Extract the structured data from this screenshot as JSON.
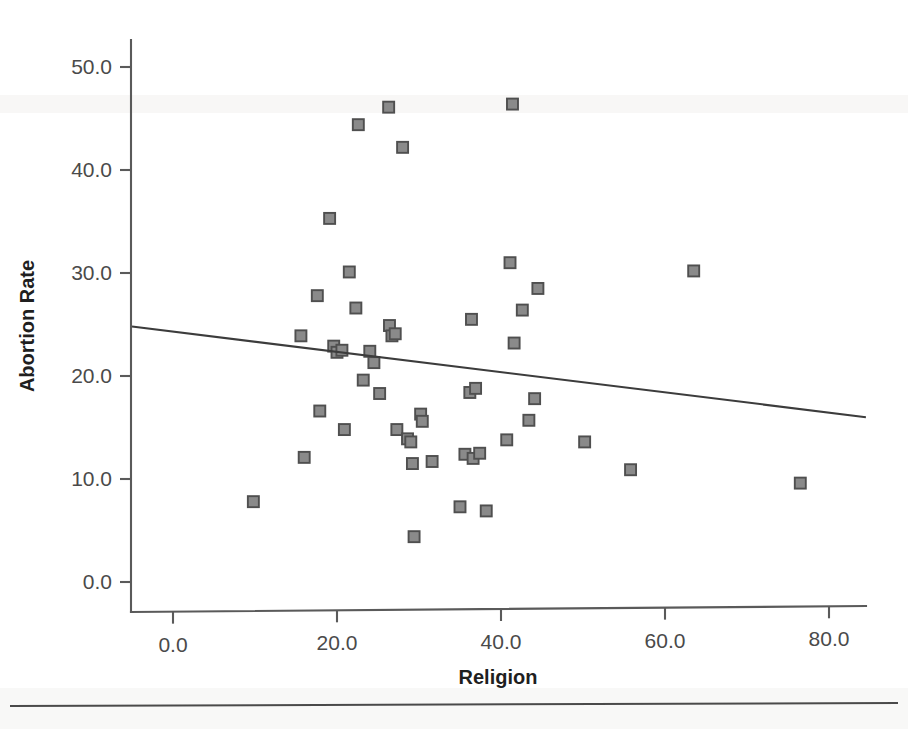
{
  "chart_data": {
    "type": "scatter",
    "title": "",
    "xlabel": "Religion",
    "ylabel": "Abortion Rate",
    "xlim": [
      -5.0,
      84.5
    ],
    "ylim": [
      -2.0,
      52.0
    ],
    "xticks": [
      "0.0",
      "20.0",
      "40.0",
      "60.0",
      "80.0"
    ],
    "xtick_values": [
      0,
      20,
      40,
      60,
      80
    ],
    "yticks": [
      "0.0",
      "10.0",
      "20.0",
      "30.0",
      "40.0",
      "50.0"
    ],
    "ytick_values": [
      0,
      10,
      20,
      30,
      40,
      50
    ],
    "grid": false,
    "legend": null,
    "marker_style": "filled-square",
    "marker_fill": "#8a8a8a",
    "marker_edge": "#4f4f4f",
    "points": [
      {
        "x": 9.8,
        "y": 7.8
      },
      {
        "x": 15.6,
        "y": 23.9
      },
      {
        "x": 16.0,
        "y": 12.1
      },
      {
        "x": 17.6,
        "y": 27.8
      },
      {
        "x": 17.9,
        "y": 16.6
      },
      {
        "x": 19.1,
        "y": 35.3
      },
      {
        "x": 19.6,
        "y": 22.9
      },
      {
        "x": 20.0,
        "y": 22.3
      },
      {
        "x": 20.6,
        "y": 22.5
      },
      {
        "x": 20.9,
        "y": 14.8
      },
      {
        "x": 21.5,
        "y": 30.1
      },
      {
        "x": 22.3,
        "y": 26.6
      },
      {
        "x": 22.6,
        "y": 44.4
      },
      {
        "x": 23.2,
        "y": 19.6
      },
      {
        "x": 24.0,
        "y": 22.4
      },
      {
        "x": 24.5,
        "y": 21.3
      },
      {
        "x": 25.2,
        "y": 18.3
      },
      {
        "x": 26.3,
        "y": 46.1
      },
      {
        "x": 26.4,
        "y": 24.9
      },
      {
        "x": 26.7,
        "y": 23.9
      },
      {
        "x": 27.1,
        "y": 24.1
      },
      {
        "x": 27.3,
        "y": 14.8
      },
      {
        "x": 28.0,
        "y": 42.2
      },
      {
        "x": 28.6,
        "y": 13.9
      },
      {
        "x": 29.0,
        "y": 13.6
      },
      {
        "x": 29.2,
        "y": 11.5
      },
      {
        "x": 29.4,
        "y": 4.4
      },
      {
        "x": 30.2,
        "y": 16.3
      },
      {
        "x": 30.4,
        "y": 15.6
      },
      {
        "x": 31.6,
        "y": 11.7
      },
      {
        "x": 35.0,
        "y": 7.3
      },
      {
        "x": 35.6,
        "y": 12.4
      },
      {
        "x": 36.2,
        "y": 18.4
      },
      {
        "x": 36.4,
        "y": 25.5
      },
      {
        "x": 36.6,
        "y": 12.0
      },
      {
        "x": 36.9,
        "y": 18.8
      },
      {
        "x": 37.4,
        "y": 12.5
      },
      {
        "x": 38.2,
        "y": 6.9
      },
      {
        "x": 40.7,
        "y": 13.8
      },
      {
        "x": 41.1,
        "y": 31.0
      },
      {
        "x": 41.4,
        "y": 46.4
      },
      {
        "x": 41.6,
        "y": 23.2
      },
      {
        "x": 42.6,
        "y": 26.4
      },
      {
        "x": 43.4,
        "y": 15.7
      },
      {
        "x": 44.1,
        "y": 17.8
      },
      {
        "x": 44.5,
        "y": 28.5
      },
      {
        "x": 50.2,
        "y": 13.6
      },
      {
        "x": 55.8,
        "y": 10.9
      },
      {
        "x": 63.5,
        "y": 30.2
      },
      {
        "x": 76.5,
        "y": 9.6
      }
    ],
    "trend_line": {
      "name": "linear-fit",
      "x_start": -5.0,
      "y_start": 24.8,
      "x_end": 84.5,
      "y_end": 16.0
    }
  }
}
